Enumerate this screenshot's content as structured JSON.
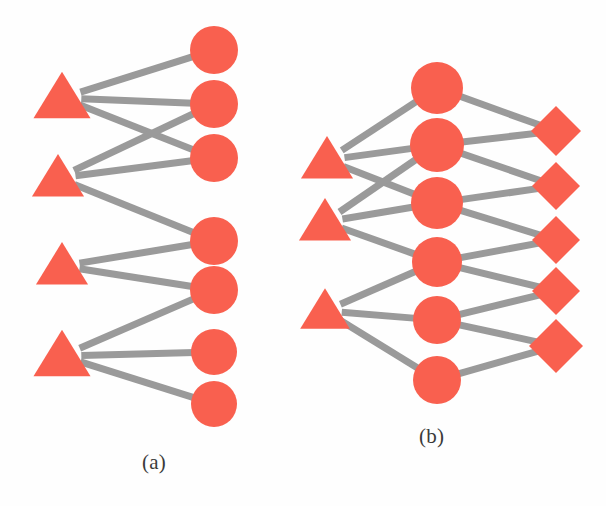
{
  "figure": {
    "width": 606,
    "height": 506,
    "background": "#fefefe"
  },
  "style": {
    "node_fill": "#F9604F",
    "node_highlight": "#FDB39F",
    "edge_color": "#9A9A9A",
    "edge_width": 7,
    "label_color": "#3A3A3A"
  },
  "panels": [
    {
      "id": "a",
      "label": "(a)",
      "label_x": 142,
      "label_y": 450,
      "layers": [
        {
          "name": "triangles",
          "shape": "triangle",
          "count": 4,
          "nodes": [
            {
              "id": "a-t1",
              "x": 62,
              "y": 98,
              "size": 46
            },
            {
              "id": "a-t2",
              "x": 58,
              "y": 178,
              "size": 42
            },
            {
              "id": "a-t3",
              "x": 62,
              "y": 266,
              "size": 42
            },
            {
              "id": "a-t4",
              "x": 62,
              "y": 356,
              "size": 46
            }
          ]
        },
        {
          "name": "circles",
          "shape": "circle",
          "count": 7,
          "nodes": [
            {
              "id": "a-c1",
              "x": 214,
              "y": 50,
              "r": 24
            },
            {
              "id": "a-c2",
              "x": 214,
              "y": 104,
              "r": 24
            },
            {
              "id": "a-c3",
              "x": 214,
              "y": 158,
              "r": 24
            },
            {
              "id": "a-c4",
              "x": 214,
              "y": 241,
              "r": 24
            },
            {
              "id": "a-c5",
              "x": 214,
              "y": 290,
              "r": 24
            },
            {
              "id": "a-c6",
              "x": 214,
              "y": 352,
              "r": 23
            },
            {
              "id": "a-c7",
              "x": 214,
              "y": 404,
              "r": 23
            }
          ]
        }
      ],
      "edges": [
        {
          "from": "a-t1",
          "to": "a-c1"
        },
        {
          "from": "a-t1",
          "to": "a-c2"
        },
        {
          "from": "a-t1",
          "to": "a-c3"
        },
        {
          "from": "a-t2",
          "to": "a-c2"
        },
        {
          "from": "a-t2",
          "to": "a-c3"
        },
        {
          "from": "a-t2",
          "to": "a-c4"
        },
        {
          "from": "a-t3",
          "to": "a-c4"
        },
        {
          "from": "a-t3",
          "to": "a-c5"
        },
        {
          "from": "a-t4",
          "to": "a-c5"
        },
        {
          "from": "a-t4",
          "to": "a-c6"
        },
        {
          "from": "a-t4",
          "to": "a-c7"
        }
      ]
    },
    {
      "id": "b",
      "label": "(b)",
      "label_x": 419,
      "label_y": 424,
      "layers": [
        {
          "name": "triangles",
          "shape": "triangle",
          "count": 3,
          "nodes": [
            {
              "id": "b-t1",
              "x": 327,
              "y": 160,
              "size": 42
            },
            {
              "id": "b-t2",
              "x": 325,
              "y": 222,
              "size": 42
            },
            {
              "id": "b-t3",
              "x": 325,
              "y": 311,
              "size": 40
            }
          ]
        },
        {
          "name": "circles",
          "shape": "circle",
          "count": 6,
          "nodes": [
            {
              "id": "b-c1",
              "x": 437,
              "y": 88,
              "r": 26
            },
            {
              "id": "b-c2",
              "x": 437,
              "y": 145,
              "r": 27
            },
            {
              "id": "b-c3",
              "x": 437,
              "y": 203,
              "r": 26
            },
            {
              "id": "b-c4",
              "x": 437,
              "y": 262,
              "r": 25
            },
            {
              "id": "b-c5",
              "x": 437,
              "y": 320,
              "r": 24
            },
            {
              "id": "b-c6",
              "x": 437,
              "y": 380,
              "r": 24
            }
          ]
        },
        {
          "name": "diamonds",
          "shape": "diamond",
          "count": 5,
          "nodes": [
            {
              "id": "b-d1",
              "x": 556,
              "y": 131,
              "r": 25
            },
            {
              "id": "b-d2",
              "x": 556,
              "y": 186,
              "r": 24
            },
            {
              "id": "b-d3",
              "x": 556,
              "y": 240,
              "r": 24
            },
            {
              "id": "b-d4",
              "x": 556,
              "y": 291,
              "r": 24
            },
            {
              "id": "b-d5",
              "x": 556,
              "y": 346,
              "r": 27
            }
          ]
        }
      ],
      "edges": [
        {
          "from": "b-t1",
          "to": "b-c1"
        },
        {
          "from": "b-t1",
          "to": "b-c2"
        },
        {
          "from": "b-t1",
          "to": "b-c3"
        },
        {
          "from": "b-t2",
          "to": "b-c2"
        },
        {
          "from": "b-t2",
          "to": "b-c3"
        },
        {
          "from": "b-t2",
          "to": "b-c4"
        },
        {
          "from": "b-t3",
          "to": "b-c4"
        },
        {
          "from": "b-t3",
          "to": "b-c5"
        },
        {
          "from": "b-t3",
          "to": "b-c6"
        },
        {
          "from": "b-c1",
          "to": "b-d1"
        },
        {
          "from": "b-c2",
          "to": "b-d1"
        },
        {
          "from": "b-c2",
          "to": "b-d2"
        },
        {
          "from": "b-c3",
          "to": "b-d2"
        },
        {
          "from": "b-c3",
          "to": "b-d3"
        },
        {
          "from": "b-c4",
          "to": "b-d3"
        },
        {
          "from": "b-c4",
          "to": "b-d4"
        },
        {
          "from": "b-c5",
          "to": "b-d4"
        },
        {
          "from": "b-c5",
          "to": "b-d5"
        },
        {
          "from": "b-c6",
          "to": "b-d5"
        }
      ]
    }
  ]
}
